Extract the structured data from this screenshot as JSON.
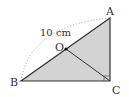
{
  "diagram": {
    "type": "geometry",
    "shape": "right triangle ABC with right angle at C",
    "points": {
      "A": {
        "label": "A",
        "x": 110,
        "y": 18
      },
      "B": {
        "label": "B",
        "x": 21,
        "y": 81
      },
      "C": {
        "label": "C",
        "x": 110,
        "y": 81
      },
      "O": {
        "label": "O",
        "x": 66,
        "y": 49
      }
    },
    "measurement": {
      "label": "10 cm",
      "refers_to": "arc from B to A"
    },
    "segments": [
      "AB",
      "BC",
      "CA",
      "OC"
    ],
    "arc": {
      "from": "B",
      "to": "A",
      "style": "dotted"
    },
    "right_angle_at": "C",
    "colors": {
      "fill": "#d3d3d3",
      "stroke": "#333333",
      "arc": "#9a9a9a"
    }
  }
}
